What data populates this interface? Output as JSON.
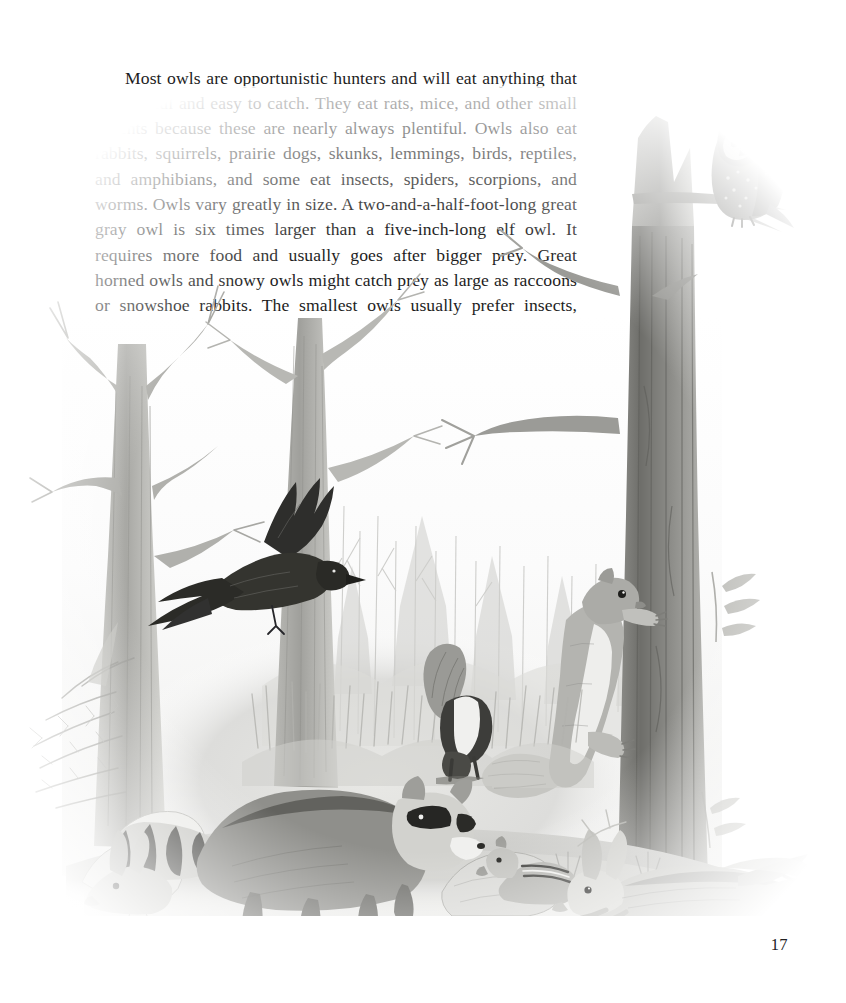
{
  "page": {
    "number": "17",
    "background_color": "#ffffff",
    "text_color": "#1d1d1d"
  },
  "body": {
    "paragraph": "Most owls are opportunistic hunters and will eat anything that is plentiful and easy to catch. They eat rats, mice, and other small rodents because these are nearly always plentiful. Owls also eat rabbits, squirrels, prairie dogs, skunks, lemmings, birds, reptiles, and amphibians, and some eat insects, spiders, scorpions, and worms. Owls vary greatly in size. A two-and-a-half-foot-long great gray owl is six times larger than a five-inch-long elf owl. It requires more food and usually goes after bigger prey. Great horned owls and snowy owls might catch prey as large as raccoons or snowshoe rabbits. The smallest owls usually prefer insects, earthworms, and small reptiles."
  },
  "illustration": {
    "title": "forest-scene-with-owl-and-prey-animals",
    "medium": "graphite pencil drawing",
    "palette": {
      "lightest": "#f2f2f1",
      "light": "#dcdcda",
      "mid": "#b4b4b1",
      "dark": "#7e7e7b",
      "darkest": "#3a3a38",
      "ink": "#23231f"
    },
    "subjects": [
      {
        "name": "owl-perched",
        "label": "owl perched on dead tree snag"
      },
      {
        "name": "crow-in-flight",
        "label": "crow in flight"
      },
      {
        "name": "squirrel-climbing",
        "label": "squirrel climbing tree trunk"
      },
      {
        "name": "raccoon-walking",
        "label": "raccoon walking over rocks"
      },
      {
        "name": "skunk-standing",
        "label": "skunk in clearing"
      },
      {
        "name": "chipmunk-on-rock",
        "label": "chipmunk on rock"
      },
      {
        "name": "rabbit-running",
        "label": "rabbit running"
      },
      {
        "name": "rabbit-small-left",
        "label": "small rabbit at left"
      },
      {
        "name": "mouse-ground",
        "label": "mouse on the ground"
      },
      {
        "name": "dead-tree-left",
        "label": "bare dead tree at left"
      },
      {
        "name": "dead-tree-center",
        "label": "bare dead tree at center"
      },
      {
        "name": "dead-tree-right",
        "label": "tall dead tree trunk at right"
      },
      {
        "name": "conifer-shrub",
        "label": "evergreen shrub at lower left"
      },
      {
        "name": "forest-background",
        "label": "misty background forest"
      },
      {
        "name": "rocky-ground",
        "label": "rocky pebbled ground"
      }
    ]
  }
}
